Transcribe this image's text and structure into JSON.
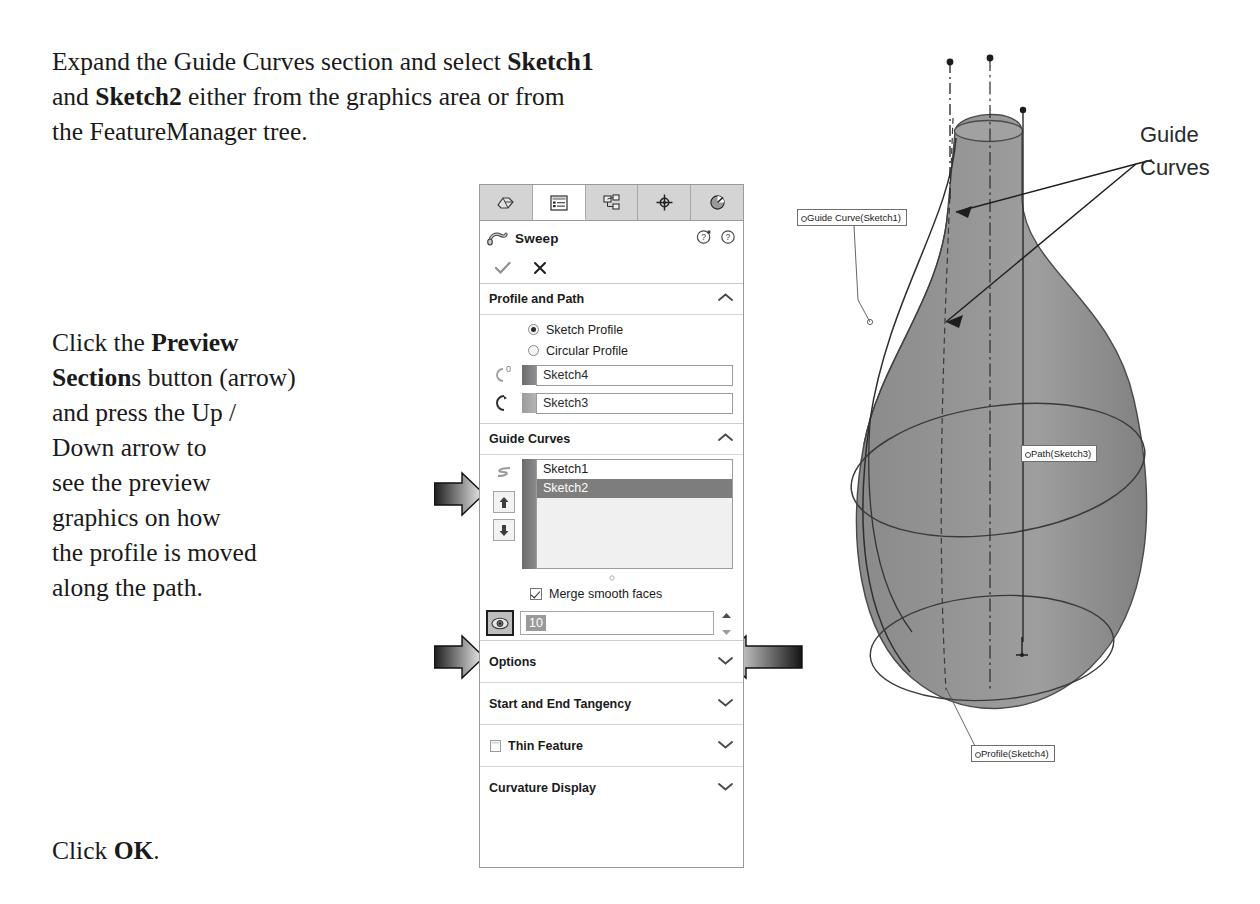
{
  "instructions": {
    "intro_line1_a": "Expand the Guide Curves section and select ",
    "intro_line1_b": "Sketch1",
    "intro_line2_a": "and ",
    "intro_line2_b": "Sketch2",
    "intro_line2_c": " either from the graphics area or from",
    "intro_line3": "the FeatureManager tree.",
    "preview_a": "Click the ",
    "preview_b": "Preview",
    "preview_c": "Section",
    "preview_d": "s button (arrow)",
    "preview_e": "and press the Up /",
    "preview_f": "Down arrow to",
    "preview_g": "see the preview",
    "preview_h": "graphics on how",
    "preview_i": "the profile is moved",
    "preview_j": "along the path.",
    "ok_a": "Click ",
    "ok_b": "OK",
    "ok_c": "."
  },
  "property_manager": {
    "tabs": [
      {
        "name": "feature-manager-tree-tab",
        "icon": "feature-tree-icon",
        "active": false
      },
      {
        "name": "property-manager-tab",
        "icon": "property-list-icon",
        "active": true
      },
      {
        "name": "configuration-manager-tab",
        "icon": "configuration-icon",
        "active": false
      },
      {
        "name": "dimxpert-manager-tab",
        "icon": "crosshair-target-icon",
        "active": false
      },
      {
        "name": "display-manager-tab",
        "icon": "appearance-sphere-icon",
        "active": false
      }
    ],
    "title": "Sweep",
    "title_icon": "sweep-icon",
    "help_icons": [
      "help-whats-new-icon",
      "help-question-icon"
    ],
    "confirm": {
      "ok_icon": "checkmark-icon",
      "cancel_icon": "cross-icon"
    },
    "sections": {
      "profile_and_path": {
        "label": "Profile and Path",
        "expanded": true,
        "chevron": "chevron-up-icon",
        "radios": [
          {
            "label": "Sketch Profile",
            "selected": true
          },
          {
            "label": "Circular Profile",
            "selected": false
          }
        ],
        "profile_field": {
          "icon": "profile-sweep-icon",
          "value": "Sketch4"
        },
        "path_field": {
          "icon": "path-sweep-icon",
          "value": "Sketch3"
        }
      },
      "guide_curves": {
        "label": "Guide Curves",
        "expanded": true,
        "chevron": "chevron-up-icon",
        "list_icon": "guide-curve-icon",
        "move_up_icon": "arrow-up-icon",
        "move_down_icon": "arrow-down-icon",
        "items": [
          {
            "label": "Sketch1",
            "selected": false
          },
          {
            "label": "Sketch2",
            "selected": true
          }
        ],
        "merge_checkbox": {
          "label": "Merge smooth faces",
          "checked": true
        },
        "preview_sections": {
          "button_icon": "eye-preview-sections-icon",
          "pressed": true,
          "value": "10",
          "spinner_up_icon": "spinner-up-icon",
          "spinner_down_icon": "spinner-down-icon"
        }
      },
      "collapsed": [
        {
          "label": "Options",
          "chevron": "chevron-down-icon",
          "lead_icon": null
        },
        {
          "label": "Start and End Tangency",
          "chevron": "chevron-down-icon",
          "lead_icon": null
        },
        {
          "label": "Thin Feature",
          "chevron": "chevron-down-icon",
          "lead_icon": "thin-feature-checkbox-icon"
        },
        {
          "label": "Curvature Display",
          "chevron": "chevron-down-icon",
          "lead_icon": null
        }
      ]
    }
  },
  "graphics_area": {
    "model": "swept-vase-solid",
    "callouts": [
      {
        "name": "guide-curve-callout",
        "text": "Guide Curve(Sketch1)"
      },
      {
        "name": "path-callout",
        "text": "Path(Sketch3)"
      },
      {
        "name": "profile-callout",
        "text": "Profile(Sketch4)"
      }
    ],
    "annotation": {
      "line1": "Guide",
      "line2": "Curves"
    }
  },
  "colors": {
    "model_fill": "#8d8d8d",
    "model_fill_light": "#9b9b9b",
    "panel_bg": "#ffffff",
    "panel_border": "#9a9a9a",
    "tab_inactive": "#d4d4d4",
    "list_selection": "#7d7d7d",
    "arrow_dark": "#2b2b2b"
  }
}
